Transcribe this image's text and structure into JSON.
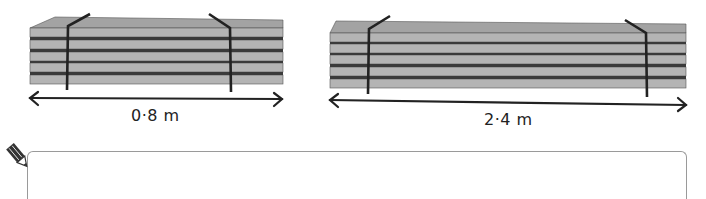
{
  "stacks": [
    {
      "id": "short-stack",
      "length_label": "0·8 m",
      "plank_count": 5
    },
    {
      "id": "long-stack",
      "length_label": "2·4 m",
      "plank_count": 5
    }
  ],
  "answer_area": {
    "icon": "pencil-icon",
    "value": ""
  },
  "colors": {
    "plank_face": "#b4b4b4",
    "plank_top": "#a3a3a3",
    "plank_gap": "#3a3a3a",
    "strap": "#222222",
    "arrow": "#222222",
    "box_border": "#9a9a9a"
  }
}
